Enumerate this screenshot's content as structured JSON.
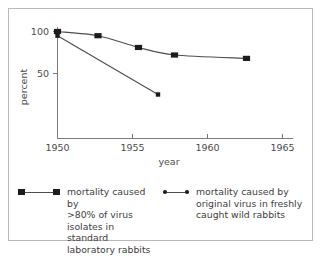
{
  "chart_data": {
    "type": "line",
    "title": "",
    "xlabel": "year",
    "ylabel": "percent",
    "xlim": [
      1949,
      1966
    ],
    "ylim": [
      8,
      104
    ],
    "xticks": [
      1950,
      1955,
      1960,
      1965
    ],
    "xticklabels": [
      "1950",
      "1955",
      "1960",
      "1965"
    ],
    "yticks": [
      50,
      100
    ],
    "yticklabels": [
      "50",
      "100"
    ],
    "grid": false,
    "legend_position": "bottom",
    "series": [
      {
        "name": "mortality caused by >80% of virus isolates in standard laboratory rabbits",
        "marker": "square",
        "x": [
          1950.0,
          1952.7,
          1955.4,
          1957.8,
          1962.6
        ],
        "values": [
          100,
          95,
          81,
          72,
          68
        ]
      },
      {
        "name": "mortality caused by original virus in freshly caught wild rabbits",
        "marker": "circle",
        "x": [
          1950.0,
          1956.7
        ],
        "values": [
          95,
          25
        ]
      }
    ]
  },
  "axes": {
    "ylabel": "percent",
    "xlabel": "year",
    "xticklabels": [
      "1950",
      "1955",
      "1960",
      "1965"
    ],
    "yticklabels": [
      "100",
      "50"
    ]
  },
  "legend": {
    "entries": [
      {
        "marker": "square-line",
        "label": "mortality caused by\n>80% of virus\nisolates in standard\nlaboratory rabbits"
      },
      {
        "marker": "dot-line",
        "label": "mortality caused by\noriginal virus in freshly\ncaught wild rabbits"
      }
    ]
  }
}
